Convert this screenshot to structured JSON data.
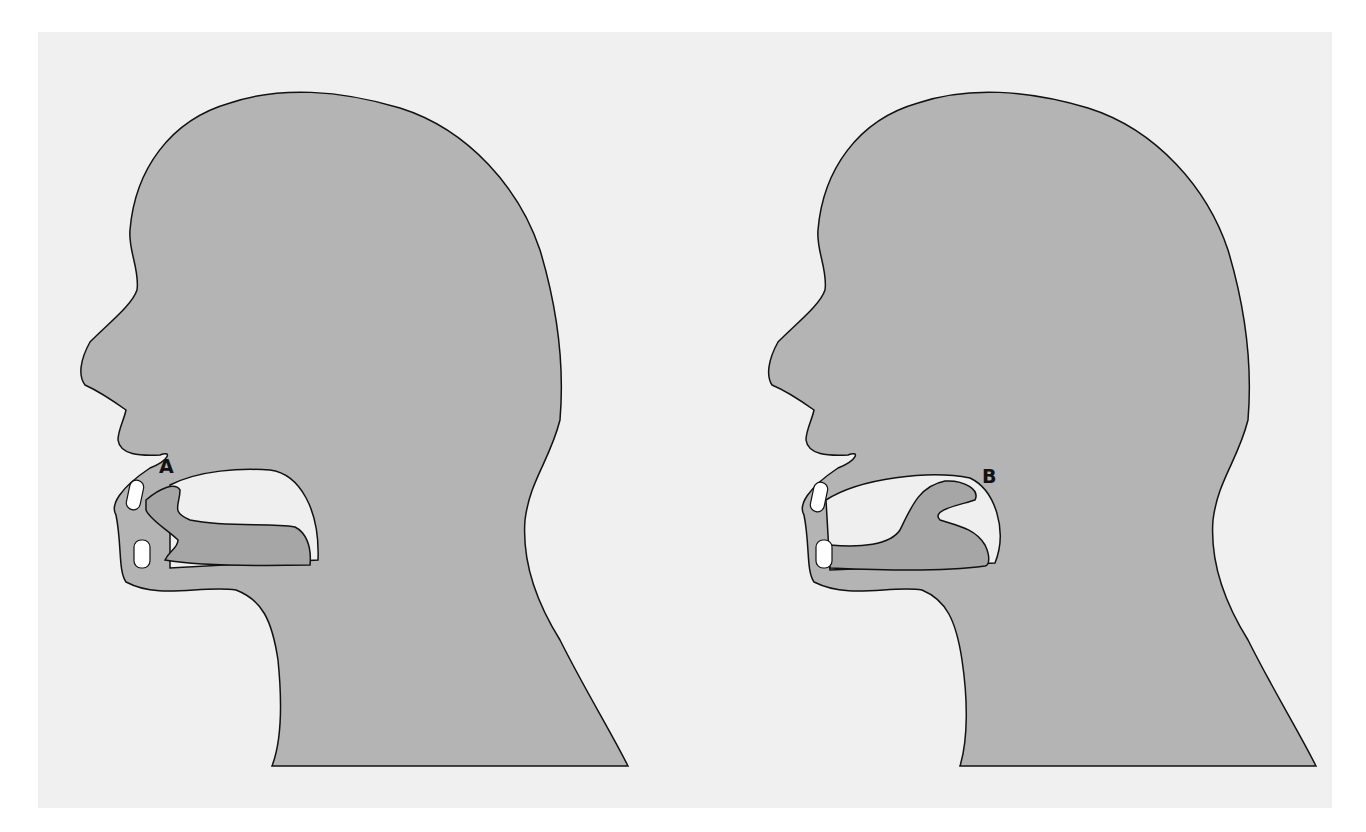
{
  "figure": {
    "colors": {
      "background": "#f0f0f0",
      "head_fill": "#b4b4b4",
      "tongue_fill": "#a6a6a6",
      "cavity_fill": "#efefef",
      "teeth_fill": "#ffffff",
      "outline": "#111111"
    },
    "panels": [
      {
        "id": "left",
        "label": "A",
        "tongue_position": "front (tip raised near upper teeth)"
      },
      {
        "id": "right",
        "label": "B",
        "tongue_position": "back (dorsum raised toward soft palate)"
      }
    ]
  }
}
